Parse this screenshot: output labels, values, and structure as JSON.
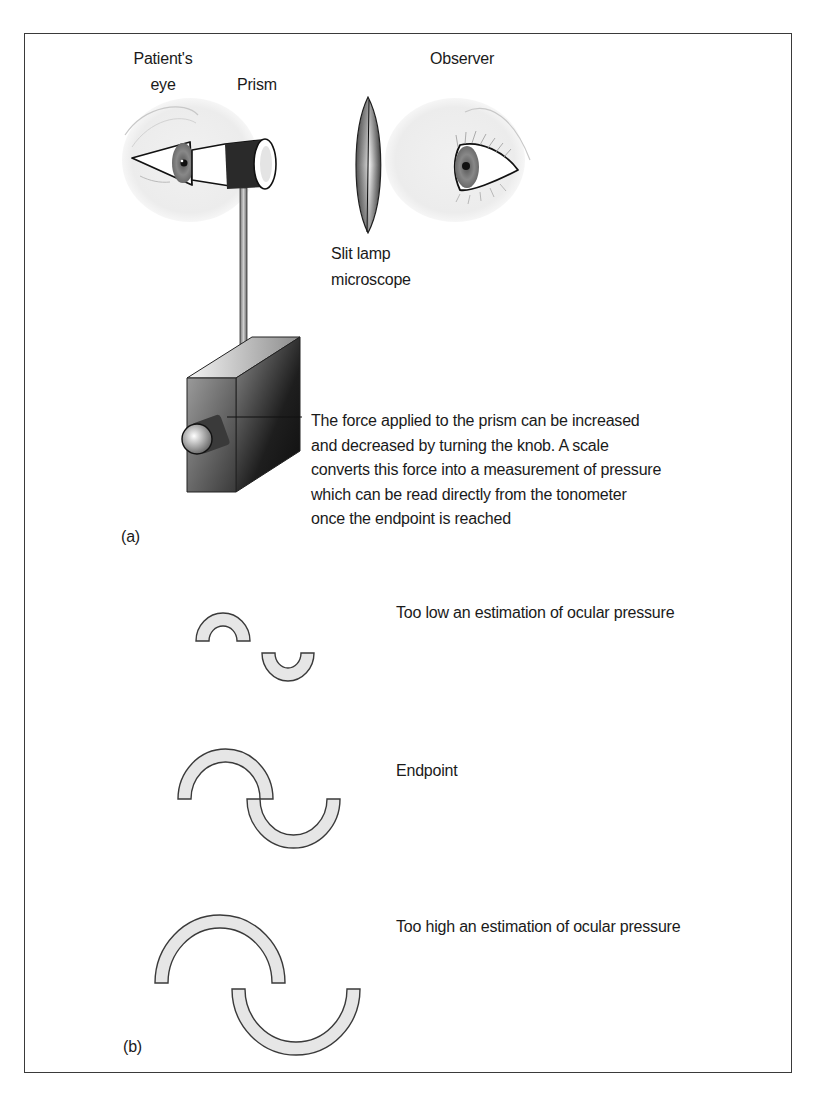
{
  "figure": {
    "panel_a": {
      "label": "(a)",
      "labels": {
        "patient_eye_line1": "Patient's",
        "patient_eye_line2": "eye",
        "prism": "Prism",
        "observer": "Observer",
        "slit_lamp_line1": "Slit lamp",
        "slit_lamp_line2": "microscope"
      },
      "description_lines": [
        "The force applied to the prism can be increased",
        "and decreased by turning the knob. A scale",
        "converts this force into a measurement of pressure",
        "which can be read directly from the tonometer",
        "once the endpoint is reached"
      ]
    },
    "panel_b": {
      "label": "(b)",
      "rows": [
        {
          "caption": "Too low an estimation of ocular pressure",
          "state": "too-low"
        },
        {
          "caption": "Endpoint",
          "state": "endpoint"
        },
        {
          "caption": "Too high an estimation of ocular pressure",
          "state": "too-high"
        }
      ]
    },
    "colors": {
      "frame": "#3a3a3a",
      "semicircle_fill": "#e6e6e6",
      "semicircle_stroke": "#3a3a3a",
      "skin_shadow": "#ececec",
      "prism_band": "#2a2a2a"
    }
  }
}
